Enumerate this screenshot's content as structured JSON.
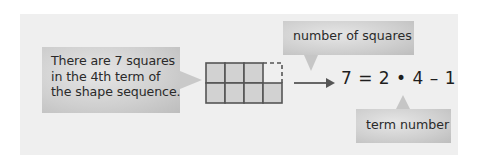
{
  "callouts": {
    "statement": {
      "lines": [
        "There are 7 squares",
        "in the 4th term of",
        "the shape sequence."
      ]
    },
    "top_label": "number of squares",
    "bottom_label": "term number"
  },
  "equation": "7 = 2 • 4 – 1",
  "figure": {
    "rows": 2,
    "columns": 4,
    "filled_squares": 7,
    "dashed_squares": 1
  },
  "colors": {
    "panel_background": "#efefef",
    "callout_fill": "#cfcfcf",
    "square_fill": "#d2d2d2",
    "grid_stroke": "#555555",
    "arrow": "#666666",
    "text": "#2a2a2a"
  }
}
